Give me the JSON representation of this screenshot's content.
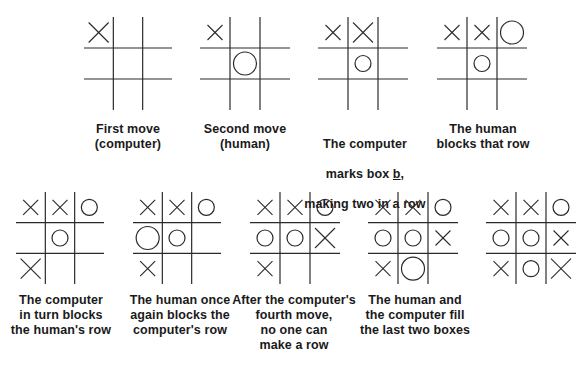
{
  "figure": {
    "colors": {
      "ink": "#2a2a2a",
      "background": "#ffffff"
    },
    "boards": [
      {
        "id": "board-1",
        "caption": "First move\n(computer)",
        "cells": [
          "X",
          "",
          "",
          "",
          "",
          "",
          "",
          "",
          ""
        ],
        "mark_sizes": {
          "0": "large"
        }
      },
      {
        "id": "board-2",
        "caption": "Second move\n(human)",
        "cells": [
          "X",
          "",
          "",
          "",
          "O",
          "",
          "",
          "",
          ""
        ],
        "mark_sizes": {
          "0": "small",
          "4": "large"
        }
      },
      {
        "id": "board-3",
        "caption": "The computer\nmarks box b,\nmaking two in a row",
        "cells": [
          "X",
          "X",
          "",
          "",
          "O",
          "",
          "",
          "",
          ""
        ],
        "mark_sizes": {
          "0": "small",
          "1": "large",
          "4": "small"
        }
      },
      {
        "id": "board-4",
        "caption": "The human\nblocks that row",
        "cells": [
          "X",
          "X",
          "O",
          "",
          "O",
          "",
          "",
          "",
          ""
        ],
        "mark_sizes": {
          "0": "small",
          "1": "small",
          "2": "large",
          "4": "small"
        }
      },
      {
        "id": "board-5",
        "caption": "The computer\nin turn blocks\nthe human's row",
        "cells": [
          "X",
          "X",
          "O",
          "",
          "O",
          "",
          "X",
          "",
          ""
        ],
        "mark_sizes": {
          "0": "small",
          "1": "small",
          "2": "small",
          "4": "small",
          "6": "large"
        }
      },
      {
        "id": "board-6",
        "caption": "The human once\nagain blocks the\ncomputer's row",
        "cells": [
          "X",
          "X",
          "O",
          "O",
          "O",
          "",
          "X",
          "",
          ""
        ],
        "mark_sizes": {
          "0": "small",
          "1": "small",
          "2": "small",
          "3": "large",
          "4": "small",
          "6": "small"
        }
      },
      {
        "id": "board-7",
        "caption": "After the computer's\nfourth move,\nno one can\nmake a row",
        "cells": [
          "X",
          "X",
          "O",
          "O",
          "O",
          "X",
          "X",
          "",
          ""
        ],
        "mark_sizes": {
          "0": "small",
          "1": "small",
          "2": "small",
          "3": "small",
          "4": "small",
          "5": "large",
          "6": "small"
        }
      },
      {
        "id": "board-8",
        "caption": "The human and\nthe computer fill\nthe last two boxes",
        "cells": [
          "X",
          "X",
          "O",
          "O",
          "O",
          "X",
          "X",
          "O",
          ""
        ],
        "mark_sizes": {
          "0": "small",
          "1": "small",
          "2": "small",
          "3": "small",
          "4": "small",
          "5": "small",
          "6": "small",
          "7": "large"
        }
      },
      {
        "id": "board-9",
        "caption": "",
        "cells": [
          "X",
          "X",
          "O",
          "O",
          "O",
          "X",
          "X",
          "O",
          "X"
        ],
        "mark_sizes": {
          "0": "small",
          "1": "small",
          "2": "small",
          "3": "small",
          "4": "small",
          "5": "small",
          "6": "small",
          "7": "small",
          "8": "large"
        }
      }
    ]
  }
}
